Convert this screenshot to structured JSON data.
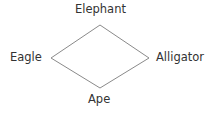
{
  "diagram": {
    "type": "diamond",
    "nodes": {
      "top": "Elephant",
      "left": "Eagle",
      "right": "Alligator",
      "bottom": "Ape"
    },
    "edges": [
      [
        "Elephant",
        "Alligator"
      ],
      [
        "Alligator",
        "Ape"
      ],
      [
        "Ape",
        "Eagle"
      ],
      [
        "Eagle",
        "Elephant"
      ]
    ],
    "line_color": "#8a8a8a"
  }
}
